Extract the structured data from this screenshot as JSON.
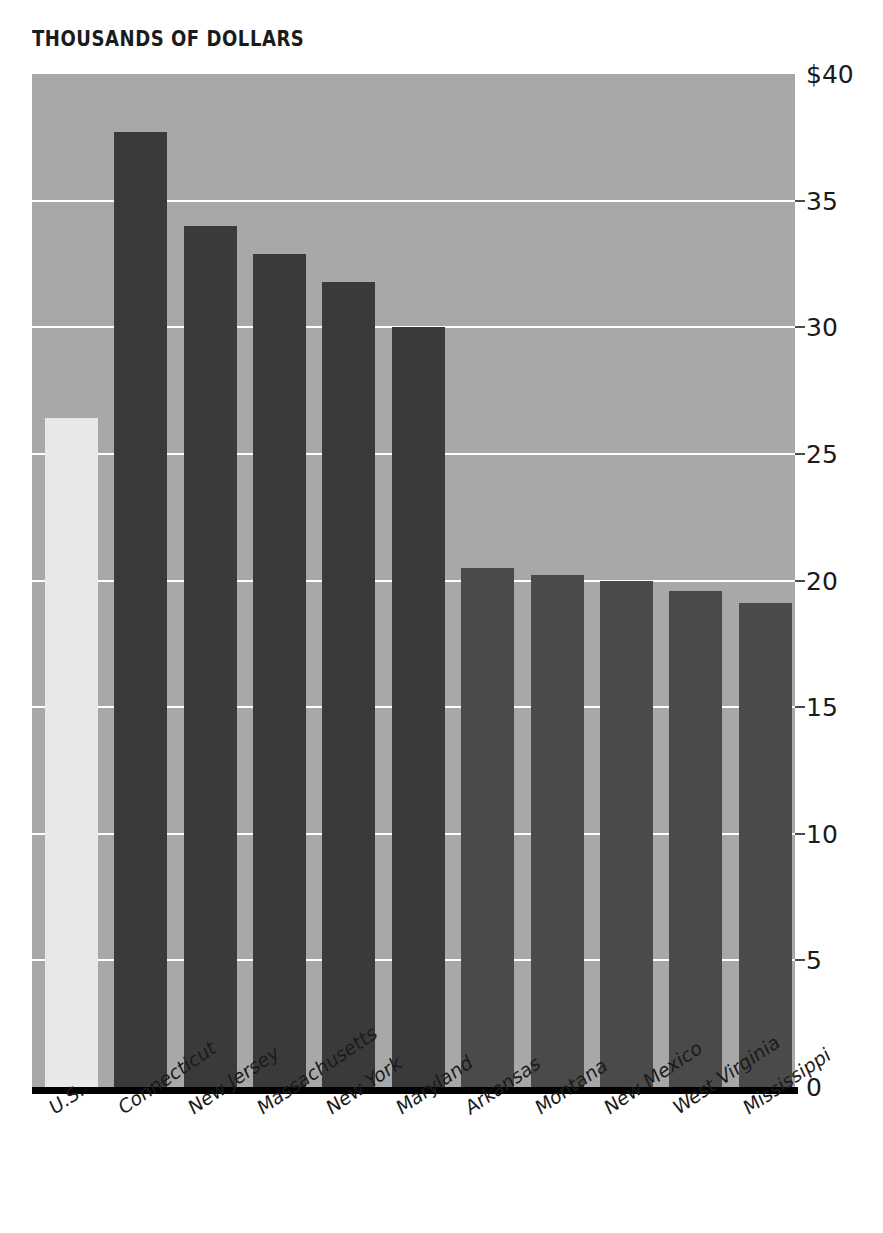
{
  "chart": {
    "title": "THOUSANDS OF DOLLARS",
    "colors": {
      "plot_background": "#a8a8a8",
      "bar_dark": "#3a3a3a",
      "bar_highlight": "#e8e8e8",
      "gridline": "#ffffff",
      "axis": "#000000",
      "text": "#1b1b1b"
    }
  },
  "chart_data": {
    "type": "bar",
    "title": "THOUSANDS OF DOLLARS",
    "xlabel": "",
    "ylabel": "",
    "ylim": [
      0,
      40
    ],
    "grid": true,
    "legend": "none",
    "yticks": [
      0,
      5,
      10,
      15,
      20,
      25,
      30,
      35,
      40
    ],
    "ytick_labels": [
      "0",
      "5",
      "10",
      "15",
      "20",
      "25",
      "30",
      "35",
      "$40"
    ],
    "categories": [
      "U.S.",
      "Connecticut",
      "New Jersey",
      "Massachusetts",
      "New York",
      "Maryland",
      "Arkansas",
      "Montana",
      "New Mexico",
      "West Virginia",
      "Mississippi"
    ],
    "values": [
      26.4,
      37.7,
      34.0,
      32.9,
      31.8,
      30.0,
      20.5,
      20.2,
      20.0,
      19.6,
      19.1
    ],
    "bar_colors": [
      "#e8e8e8",
      "#3a3a3a",
      "#3a3a3a",
      "#3a3a3a",
      "#3a3a3a",
      "#3a3a3a",
      "#4a4a4a",
      "#4a4a4a",
      "#4a4a4a",
      "#4a4a4a",
      "#4a4a4a"
    ]
  }
}
